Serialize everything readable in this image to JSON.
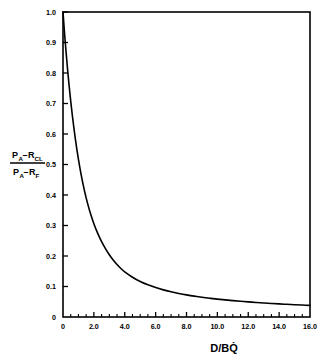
{
  "chart_data": {
    "type": "line",
    "title": "",
    "xlabel": "D/BQ̇",
    "ylabel": "(P_A − P_CL) / (P_A − P_F)",
    "ylabel_parts": {
      "num_p1": "P",
      "num_sub1": "A",
      "num_minus": "–",
      "num_p2": "R",
      "num_sub2": "CL",
      "den_p1": "P",
      "den_sub1": "A",
      "den_minus": "–",
      "den_p2": "R",
      "den_sub2": "F"
    },
    "xlim": [
      0,
      16
    ],
    "ylim": [
      0,
      1.0
    ],
    "grid": false,
    "legend": null,
    "xticks": [
      0,
      2.0,
      4.0,
      6.0,
      8.0,
      10.0,
      12.0,
      14.0,
      16.0
    ],
    "xticklabels": [
      "0",
      "2.0",
      "4.0",
      "6.0",
      "8.0",
      "10.0",
      "12.0",
      "14.0",
      "16.0"
    ],
    "x_minor_ticks": [
      0.5,
      1.0,
      1.5,
      2.5,
      3.0,
      3.5,
      4.5,
      5.0,
      5.5,
      6.5,
      7.0,
      7.5,
      8.5,
      9.0,
      9.5,
      10.5,
      11.0,
      11.5,
      12.5,
      13.0,
      13.5,
      14.5,
      15.0,
      15.5
    ],
    "yticks": [
      0,
      0.1,
      0.2,
      0.3,
      0.4,
      0.5,
      0.6,
      0.7,
      0.8,
      0.9,
      1.0
    ],
    "yticklabels": [
      "0",
      "0.1",
      "0.2",
      "0.3",
      "0.4",
      "0.5",
      "0.6",
      "0.7",
      "0.8",
      "0.9",
      "1.0"
    ],
    "series": [
      {
        "name": "pressure-ratio-decay",
        "color": "#000000",
        "linewidth": 1.6,
        "x": [
          0,
          0.1,
          0.2,
          0.3,
          0.4,
          0.5,
          0.6,
          0.7,
          0.8,
          0.9,
          1.0,
          1.2,
          1.4,
          1.6,
          1.8,
          2.0,
          2.25,
          2.5,
          2.75,
          3.0,
          3.25,
          3.5,
          3.75,
          4.0,
          4.5,
          5.0,
          5.5,
          6.0,
          6.5,
          7.0,
          7.5,
          8.0,
          8.5,
          9.0,
          9.5,
          10.0,
          10.5,
          11.0,
          11.5,
          12.0,
          12.5,
          13.0,
          13.5,
          14.0,
          14.5,
          15.0,
          15.5,
          16.0
        ],
        "values": [
          1.0,
          0.93,
          0.868,
          0.81,
          0.757,
          0.708,
          0.663,
          0.622,
          0.584,
          0.549,
          0.517,
          0.46,
          0.412,
          0.371,
          0.336,
          0.306,
          0.274,
          0.247,
          0.224,
          0.204,
          0.187,
          0.172,
          0.159,
          0.148,
          0.1305,
          0.1165,
          0.1055,
          0.0965,
          0.089,
          0.0825,
          0.0772,
          0.0725,
          0.0684,
          0.0648,
          0.0616,
          0.0587,
          0.0561,
          0.0537,
          0.0515,
          0.0495,
          0.0477,
          0.046,
          0.0444,
          0.0429,
          0.0416,
          0.0403,
          0.0391,
          0.038
        ]
      }
    ]
  },
  "axes": {
    "frame_color": "#000000"
  }
}
